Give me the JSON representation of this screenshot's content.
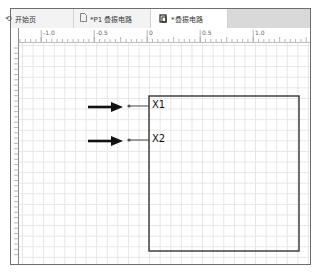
{
  "tabs": [
    {
      "label": "开始页",
      "icon": "start-page-icon",
      "glyph": "⟲",
      "active": false
    },
    {
      "label": "*P1 叠振电路",
      "icon": "document-icon",
      "glyph": "🗋",
      "active": false
    },
    {
      "label": "*叠振电路",
      "icon": "schematic-icon",
      "glyph": "ɷ",
      "active": true
    }
  ],
  "ruler": {
    "labels": [
      "-1.0",
      "-0.5",
      "0",
      "0.5",
      "1.0"
    ]
  },
  "schematic": {
    "block": {
      "border_color": "#333333"
    },
    "pins": [
      {
        "name": "X1"
      },
      {
        "name": "X2"
      }
    ],
    "arrow_color": "#111111"
  }
}
